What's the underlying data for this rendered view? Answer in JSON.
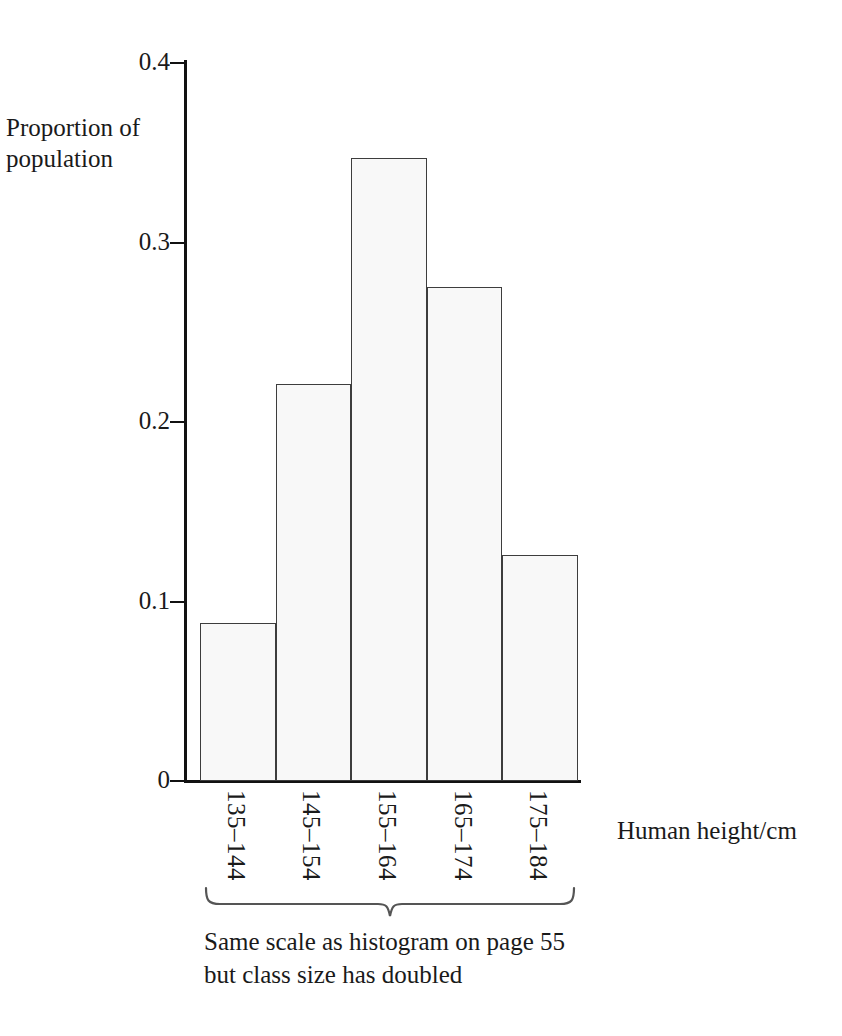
{
  "chart_data": {
    "type": "bar",
    "title": "",
    "subtitle": "",
    "xlabel": "Human height/cm",
    "ylabel": "Proportion of population",
    "categories": [
      "135–144",
      "145–154",
      "155–164",
      "165–174",
      "175–184"
    ],
    "values": [
      0.088,
      0.221,
      0.347,
      0.275,
      0.126
    ],
    "ylim": [
      0,
      0.4
    ],
    "y_ticks": [
      0.4,
      0.3,
      0.2,
      0.1,
      0
    ],
    "y_tick_labels": [
      "0.4",
      "0.3",
      "0.2",
      "0.1",
      "0"
    ],
    "grid": false,
    "legend": null,
    "annotations": [
      "Same scale as histogram on page 55",
      "but class size has doubled"
    ],
    "bar_fill_color": "#f8f8f8",
    "bar_edge_color": "#3d3d3d",
    "axis_color": "#111111",
    "text_color": "#1a1a1a"
  },
  "axis": {
    "y_title_line1": "Proportion of",
    "y_title_line2": "population",
    "x_title": "Human height/cm"
  },
  "y_ticks": [
    {
      "label": "0.4",
      "value": 0.4
    },
    {
      "label": "0.3",
      "value": 0.3
    },
    {
      "label": "0.2",
      "value": 0.2
    },
    {
      "label": "0.1",
      "value": 0.1
    },
    {
      "label": "0",
      "value": 0
    }
  ],
  "bars": [
    {
      "category": "135–144",
      "value": 0.088
    },
    {
      "category": "145–154",
      "value": 0.221
    },
    {
      "category": "155–164",
      "value": 0.347
    },
    {
      "category": "165–174",
      "value": 0.275
    },
    {
      "category": "175–184",
      "value": 0.126
    }
  ],
  "caption": {
    "line1": "Same scale as histogram on page 55",
    "line2": "but class size has doubled"
  }
}
